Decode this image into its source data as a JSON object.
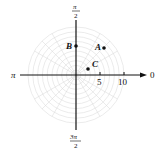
{
  "diagram": {
    "type": "polar-grid",
    "origin_px": [
      76,
      75
    ],
    "px_per_unit": 4.8,
    "grid_color": "#d6d6d6",
    "axis_color": "#111111",
    "angle_labels": {
      "right": "0",
      "top_num": "π",
      "top_den": "2",
      "left": "π",
      "bottom_num": "3π",
      "bottom_den": "2"
    },
    "tick_labels": [
      "5",
      "10"
    ],
    "points": [
      {
        "label": "A",
        "r": 8,
        "theta": "π/4"
      },
      {
        "label": "B",
        "r": 6,
        "theta": "π/2"
      },
      {
        "label": "C",
        "r": 3,
        "theta": "π/6"
      }
    ]
  }
}
